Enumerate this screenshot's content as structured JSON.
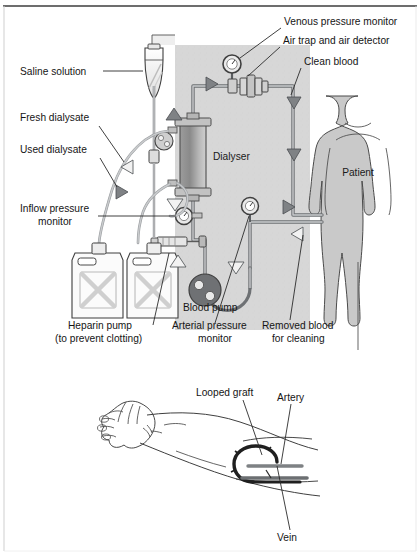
{
  "figure": {
    "type": "medical-diagram",
    "border_color": "#3c3c3c",
    "machine_panel_color": "#d8d8d8",
    "body_fill_color": "#c9c9c9",
    "ink_color": "#3a3a3a",
    "text_color": "#151515"
  },
  "top_diagram": {
    "name": "haemodialysis-machine-circuit",
    "labels": {
      "saline_solution": "Saline solution",
      "fresh_dialysate": "Fresh dialysate",
      "used_dialysate": "Used dialysate",
      "inflow_pressure_monitor_line1": "Inflow pressure",
      "inflow_pressure_monitor_line2": "monitor",
      "heparin_pump_line1": "Heparin pump",
      "heparin_pump_line2": "(to prevent clotting)",
      "blood_pump": "Blood pump",
      "arterial_pressure_monitor_line1": "Arterial pressure",
      "arterial_pressure_monitor_line2": "monitor",
      "removed_blood_line1": "Removed blood",
      "removed_blood_line2": "for cleaning",
      "venous_pressure_monitor": "Venous pressure monitor",
      "air_trap": "Air trap and air detector",
      "clean_blood": "Clean blood",
      "dialyser": "Dialyser",
      "patient": "Patient"
    }
  },
  "bottom_diagram": {
    "name": "arm-looped-graft-access",
    "labels": {
      "looped_graft": "Looped graft",
      "artery": "Artery",
      "vein": "Vein"
    }
  }
}
